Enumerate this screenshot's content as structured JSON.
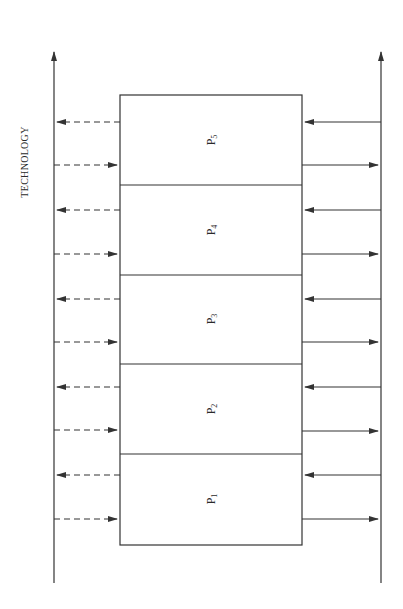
{
  "diagram": {
    "axis_label": "TECHNOLOGY",
    "colors": {
      "line": "#333333",
      "background": "#ffffff"
    },
    "processes": [
      {
        "name": "P",
        "sub": "5"
      },
      {
        "name": "P",
        "sub": "4"
      },
      {
        "name": "P",
        "sub": "3"
      },
      {
        "name": "P",
        "sub": "2"
      },
      {
        "name": "P",
        "sub": "1"
      }
    ],
    "left_axis": {
      "style": "solid",
      "direction": "up"
    },
    "right_axis": {
      "style": "solid",
      "direction": "up"
    },
    "left_arrows": {
      "style": "dashed",
      "pattern_per_process": [
        "out-to-left-axis",
        "in-from-left-axis"
      ]
    },
    "right_arrows": {
      "style": "solid",
      "pattern_per_process": [
        "in-from-right-axis",
        "out-to-right-axis"
      ]
    }
  }
}
